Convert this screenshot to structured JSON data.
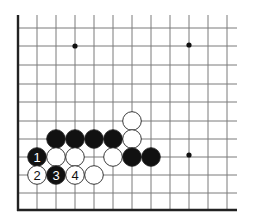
{
  "diagram": {
    "type": "go-board-corner",
    "grid": {
      "columns_x": [
        18,
        37,
        56,
        75,
        94,
        113,
        132,
        151,
        170,
        189,
        208,
        227
      ],
      "rows_y": [
        28,
        46,
        65,
        84,
        102,
        121,
        139,
        157,
        175,
        193,
        210
      ],
      "line_color": "#7a7a7a",
      "edge_color": "#222222",
      "right_extent": 237,
      "top_extent": 15
    },
    "star_points": [
      {
        "x": 75,
        "y": 46
      },
      {
        "x": 189,
        "y": 45
      },
      {
        "x": 189,
        "y": 155
      }
    ],
    "stones": [
      {
        "color": "white",
        "x": 132,
        "y": 121,
        "label": ""
      },
      {
        "color": "white",
        "x": 132,
        "y": 139,
        "label": ""
      },
      {
        "color": "black",
        "x": 56,
        "y": 139,
        "label": ""
      },
      {
        "color": "black",
        "x": 75,
        "y": 139,
        "label": ""
      },
      {
        "color": "black",
        "x": 94,
        "y": 139,
        "label": ""
      },
      {
        "color": "black",
        "x": 113,
        "y": 139,
        "label": ""
      },
      {
        "color": "black",
        "x": 37,
        "y": 157,
        "label": "1"
      },
      {
        "color": "white",
        "x": 56,
        "y": 157,
        "label": ""
      },
      {
        "color": "white",
        "x": 75,
        "y": 157,
        "label": ""
      },
      {
        "color": "white",
        "x": 113,
        "y": 157,
        "label": ""
      },
      {
        "color": "black",
        "x": 132,
        "y": 157,
        "label": ""
      },
      {
        "color": "black",
        "x": 151,
        "y": 157,
        "label": ""
      },
      {
        "color": "white",
        "x": 37,
        "y": 175,
        "label": "2"
      },
      {
        "color": "black",
        "x": 56,
        "y": 175,
        "label": "3"
      },
      {
        "color": "white",
        "x": 75,
        "y": 175,
        "label": "4"
      },
      {
        "color": "white",
        "x": 94,
        "y": 175,
        "label": ""
      }
    ],
    "stone_radius": 9.3
  }
}
